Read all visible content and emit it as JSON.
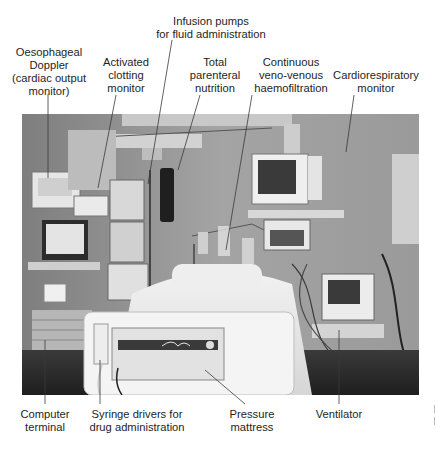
{
  "figure": {
    "photo_description": "Grayscale photograph of an ICU bed surrounded by monitoring and support equipment"
  },
  "labels_top": [
    {
      "id": "oesophageal-doppler",
      "lines": [
        "Oesophageal",
        "Doppler",
        "(cardiac output",
        "monitor)"
      ]
    },
    {
      "id": "activated-clotting",
      "lines": [
        "Activated",
        "clotting",
        "monitor"
      ]
    },
    {
      "id": "infusion-pumps",
      "lines": [
        "Infusion pumps",
        "for fluid administration"
      ]
    },
    {
      "id": "tpn",
      "lines": [
        "Total",
        "parenteral",
        "nutrition"
      ]
    },
    {
      "id": "cvvh",
      "lines": [
        "Continuous",
        "veno-venous",
        "haemofiltration"
      ]
    },
    {
      "id": "cardiorespiratory",
      "lines": [
        "Cardiorespiratory",
        "monitor"
      ]
    }
  ],
  "labels_bottom": [
    {
      "id": "computer-terminal",
      "lines": [
        "Computer",
        "terminal"
      ]
    },
    {
      "id": "syringe-drivers",
      "lines": [
        "Syringe drivers for",
        "drug administration"
      ]
    },
    {
      "id": "pressure-mattress",
      "lines": [
        "Pressure",
        "mattress"
      ]
    },
    {
      "id": "ventilator",
      "lines": [
        "Ventilator"
      ]
    }
  ],
  "colors": {
    "background": "#ffffff",
    "text": "#1e1e1e",
    "leader_line": "#3a3a3a",
    "photo_wall": "#9a9a9a",
    "photo_dark": "#2a2a2a",
    "photo_light": "#e8e8e8"
  }
}
